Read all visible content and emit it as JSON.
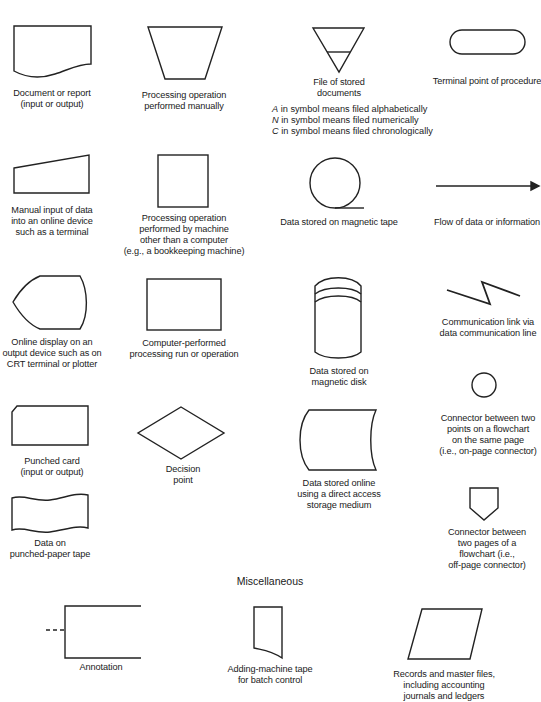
{
  "figure": {
    "section_heading": "Miscellaneous",
    "symbols": [
      {
        "id": "document",
        "shape": "document",
        "lines": [
          "Document or report",
          "(input or output)"
        ]
      },
      {
        "id": "manual-operation",
        "shape": "inverted-trapezoid",
        "lines": [
          "Processing operation",
          "performed manually"
        ]
      },
      {
        "id": "file",
        "shape": "inverted-triangle",
        "lines": [
          "File of stored",
          "documents"
        ],
        "notes": [
          {
            "letter": "A",
            "text": "in symbol means filed alphabetically"
          },
          {
            "letter": "N",
            "text": "in symbol means filed numerically"
          },
          {
            "letter": "C",
            "text": "in symbol means filed chronologically"
          }
        ]
      },
      {
        "id": "terminal",
        "shape": "rounded-pill",
        "lines": [
          "Terminal point of procedure"
        ]
      },
      {
        "id": "manual-input",
        "shape": "slanted-top-quad",
        "lines": [
          "Manual input of data",
          "into an online device",
          "such as a terminal"
        ]
      },
      {
        "id": "auxiliary-operation",
        "shape": "square",
        "lines": [
          "Processing operation",
          "performed by machine",
          "other than a computer",
          "(e.g., a bookkeeping machine)"
        ]
      },
      {
        "id": "magnetic-tape",
        "shape": "circle-with-tail",
        "lines": [
          "Data stored on magnetic tape"
        ]
      },
      {
        "id": "flow",
        "shape": "arrow",
        "lines": [
          "Flow of data or information"
        ]
      },
      {
        "id": "display",
        "shape": "display",
        "lines": [
          "Online display on an",
          "output device such as on",
          "CRT terminal or plotter"
        ]
      },
      {
        "id": "process",
        "shape": "rectangle",
        "lines": [
          "Computer-performed",
          "processing run or operation"
        ]
      },
      {
        "id": "magnetic-disk",
        "shape": "cylinder",
        "lines": [
          "Data stored on",
          "magnetic disk"
        ]
      },
      {
        "id": "communication-link",
        "shape": "zigzag",
        "lines": [
          "Communication link via",
          "data communication line"
        ]
      },
      {
        "id": "punched-card",
        "shape": "clipped-corner-rect",
        "lines": [
          "Punched card",
          "(input or output)"
        ]
      },
      {
        "id": "decision",
        "shape": "diamond",
        "lines": [
          "Decision",
          "point"
        ]
      },
      {
        "id": "online-storage",
        "shape": "stored-data",
        "lines": [
          "Data stored online",
          "using a direct access",
          "storage medium"
        ]
      },
      {
        "id": "on-page-connector",
        "shape": "circle",
        "lines": [
          "Connector between two",
          "points on a flowchart",
          "on the same page",
          "(i.e., on-page connector)"
        ]
      },
      {
        "id": "punched-tape",
        "shape": "wavy-flag",
        "lines": [
          "Data on",
          "punched-paper tape"
        ]
      },
      {
        "id": "off-page-connector",
        "shape": "pentagon-down",
        "lines": [
          "Connector between",
          "two pages of a",
          "flowchart (i.e.,",
          "off-page connector)"
        ]
      },
      {
        "id": "annotation",
        "shape": "open-bracket",
        "lines": [
          "Annotation"
        ]
      },
      {
        "id": "adding-machine-tape",
        "shape": "tape",
        "lines": [
          "Adding-machine tape",
          "for batch control"
        ]
      },
      {
        "id": "records",
        "shape": "parallelogram",
        "lines": [
          "Records and master files,",
          "including accounting",
          "journals and ledgers"
        ]
      }
    ]
  }
}
